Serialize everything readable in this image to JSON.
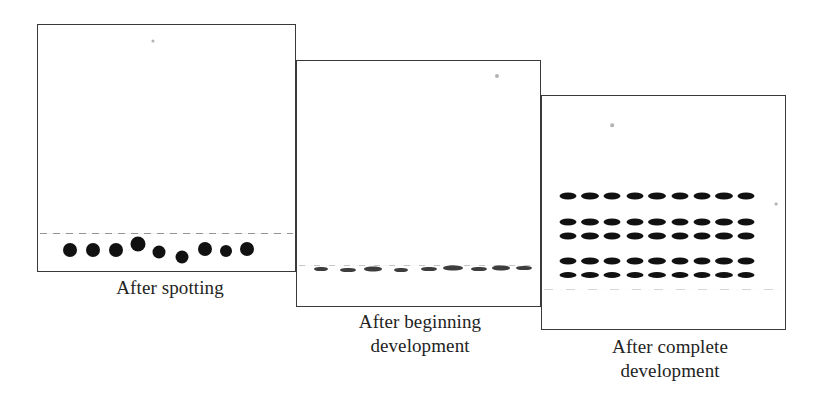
{
  "figure": {
    "background_color": "#ffffff",
    "ink_color": "#111111",
    "border_color": "#3a3a3a"
  },
  "panels": [
    {
      "id": "after-spotting",
      "caption": "After spotting",
      "stage_index": 1,
      "box": {
        "x": 37,
        "y": 24,
        "width": 259,
        "height": 248
      },
      "origin_line_y": 232,
      "marks_type": "round-spots",
      "marks": [
        {
          "x": 69,
          "y": 249,
          "w": 14,
          "h": 14
        },
        {
          "x": 92,
          "y": 249,
          "w": 14,
          "h": 14
        },
        {
          "x": 115,
          "y": 249,
          "w": 14,
          "h": 14
        },
        {
          "x": 137,
          "y": 243,
          "w": 15,
          "h": 15
        },
        {
          "x": 158,
          "y": 251,
          "w": 13,
          "h": 13
        },
        {
          "x": 181,
          "y": 256,
          "w": 13,
          "h": 13
        },
        {
          "x": 204,
          "y": 248,
          "w": 14,
          "h": 14
        },
        {
          "x": 225,
          "y": 250,
          "w": 12,
          "h": 12
        },
        {
          "x": 246,
          "y": 248,
          "w": 14,
          "h": 14
        }
      ]
    },
    {
      "id": "after-beginning-development",
      "caption": "After beginning\ndevelopment",
      "stage_index": 2,
      "box": {
        "x": 296,
        "y": 60,
        "width": 245,
        "height": 247
      },
      "origin_line_y": 264,
      "marks_type": "short-streaks",
      "marks": [
        {
          "x": 320,
          "y": 268,
          "w": 14,
          "h": 4
        },
        {
          "x": 347,
          "y": 269,
          "w": 16,
          "h": 4
        },
        {
          "x": 372,
          "y": 268,
          "w": 18,
          "h": 5
        },
        {
          "x": 400,
          "y": 269,
          "w": 14,
          "h": 4
        },
        {
          "x": 428,
          "y": 268,
          "w": 16,
          "h": 4
        },
        {
          "x": 452,
          "y": 267,
          "w": 20,
          "h": 5
        },
        {
          "x": 478,
          "y": 268,
          "w": 16,
          "h": 4
        },
        {
          "x": 500,
          "y": 267,
          "w": 18,
          "h": 5
        },
        {
          "x": 523,
          "y": 267,
          "w": 16,
          "h": 4
        }
      ]
    },
    {
      "id": "after-complete-development",
      "caption": "After complete\ndevelopment",
      "stage_index": 3,
      "box": {
        "x": 541,
        "y": 95,
        "width": 245,
        "height": 235
      },
      "origin_line_y": 288,
      "marks_type": "separated-bands",
      "lane_count": 9,
      "row_count": 5,
      "lane_x": [
        567,
        589,
        611,
        634,
        656,
        679,
        701,
        723,
        745
      ],
      "row_y": [
        195,
        221,
        235,
        260,
        274
      ],
      "band_size": {
        "w": 17,
        "h": 7
      }
    }
  ],
  "specks": [
    {
      "x": 153,
      "y": 41,
      "r": 1.6
    },
    {
      "x": 497,
      "y": 76,
      "r": 2.0
    },
    {
      "x": 612,
      "y": 125,
      "r": 1.8
    },
    {
      "x": 776,
      "y": 204,
      "r": 1.4
    }
  ]
}
